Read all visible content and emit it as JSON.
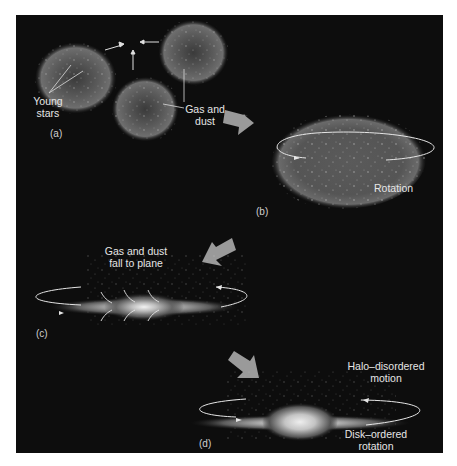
{
  "figure": {
    "colors": {
      "background": "#0d0d0d",
      "page": "#ffffff",
      "label": "#e6e6e6",
      "cloud": "#6e6e6e",
      "arrow": "#9a9a9a"
    },
    "panels": {
      "a": {
        "tag": "(a)",
        "labels": {
          "young_stars": [
            "Young",
            "stars"
          ],
          "gas_dust": [
            "Gas and",
            "dust"
          ]
        }
      },
      "b": {
        "tag": "(b)",
        "labels": {
          "rotation": "Rotation"
        }
      },
      "c": {
        "tag": "(c)",
        "labels": {
          "fall": [
            "Gas and dust",
            "fall to plane"
          ]
        }
      },
      "d": {
        "tag": "(d)",
        "labels": {
          "halo": [
            "Halo–disordered",
            "motion"
          ],
          "disk": [
            "Disk–ordered",
            "rotation"
          ]
        }
      }
    }
  }
}
